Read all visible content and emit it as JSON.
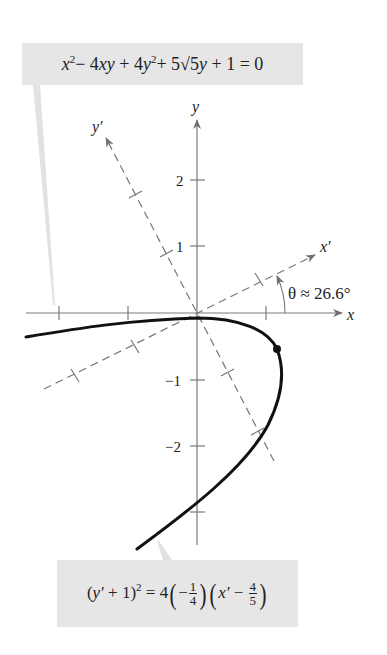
{
  "top_formula": {
    "text": "x² − 4xy + 4y² + 5√5y + 1 = 0",
    "parts": [
      "x",
      "2",
      "− 4",
      "xy",
      " + 4",
      "y",
      "2",
      "+ 5√5",
      "y",
      " + 1 = 0"
    ]
  },
  "bottom_formula": {
    "text": "(y′ + 1)² = 4(−1/4)(x′ − 4/5)",
    "lhs_open": "(",
    "lhs_var": "y′",
    "lhs_rest": " + 1)",
    "lhs_exp": "2",
    "eq": " = 4",
    "frac1_sign": "−",
    "frac1_num": "1",
    "frac1_den": "4",
    "rhs_var": "x′",
    "rhs_minus": " − ",
    "frac2_num": "4",
    "frac2_den": "5"
  },
  "axes": {
    "x_label": "x",
    "y_label": "y",
    "x_prime_label": "x′",
    "y_prime_label": "y′",
    "y_tick_labels": [
      "2",
      "1",
      "−1",
      "−2"
    ],
    "angle_label": "θ ≈ 26.6°"
  },
  "colors": {
    "box_fill": "#e6e6e6",
    "axis": "#7a7a7a",
    "curve": "#111111",
    "dashed": "#777777"
  },
  "geometry": {
    "origin": [
      197,
      313
    ],
    "unit_px": 67,
    "rotation_deg": 26.6,
    "vertex_xy": [
      0.8,
      -0.4
    ]
  }
}
